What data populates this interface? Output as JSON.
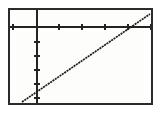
{
  "screen": {
    "device": "graphing-calculator-display",
    "background_color": "#fdfdfb",
    "frame_color": "#2b2b2b",
    "ink_color": "#232323"
  },
  "chart_data": {
    "type": "line",
    "title": "",
    "subtitle": "",
    "xlabel": "",
    "ylabel": "",
    "legend": [],
    "legend_position": "none",
    "grid": false,
    "axes": {
      "x_axis_visible": true,
      "y_axis_visible": true,
      "x_axis_screen_y": 17,
      "y_axis_screen_x": 27,
      "xlim": [
        -3.1,
        9.4
      ],
      "ylim": [
        -5.6,
        1.1
      ],
      "x_tick_interval": 2,
      "y_tick_interval": 1,
      "x_tick_labels": [],
      "y_tick_labels": [],
      "x_ticks_screen": [
        3,
        49,
        72,
        95,
        118,
        141
      ],
      "y_ticks_screen": [
        32,
        46,
        60,
        74,
        88
      ]
    },
    "series": [
      {
        "name": "y1",
        "style": "solid-pixelated",
        "color": "#1d1d1d",
        "x": [
          -3.1,
          9.4
        ],
        "y": [
          -5.4,
          0.85
        ],
        "screen_points": [
          [
            12,
            92
          ],
          [
            140,
            4
          ]
        ],
        "x_intercept_screen": 120,
        "y_intercept_screen": 81,
        "slope_screen": -0.6875
      }
    ],
    "annotations": []
  }
}
